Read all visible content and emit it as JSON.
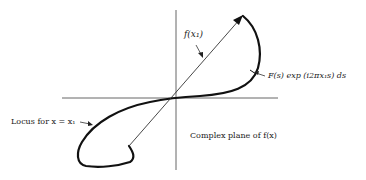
{
  "diagram": {
    "labels": {
      "phasor": "f(x₁)",
      "increment": "F(s) exp (i2πx₁s) ds",
      "locus": "Locus for x = x₁",
      "plane": "Complex plane of f(x)"
    },
    "colors": {
      "ink": "#1a1a1a",
      "axis": "#555555",
      "background": "#ffffff"
    }
  }
}
